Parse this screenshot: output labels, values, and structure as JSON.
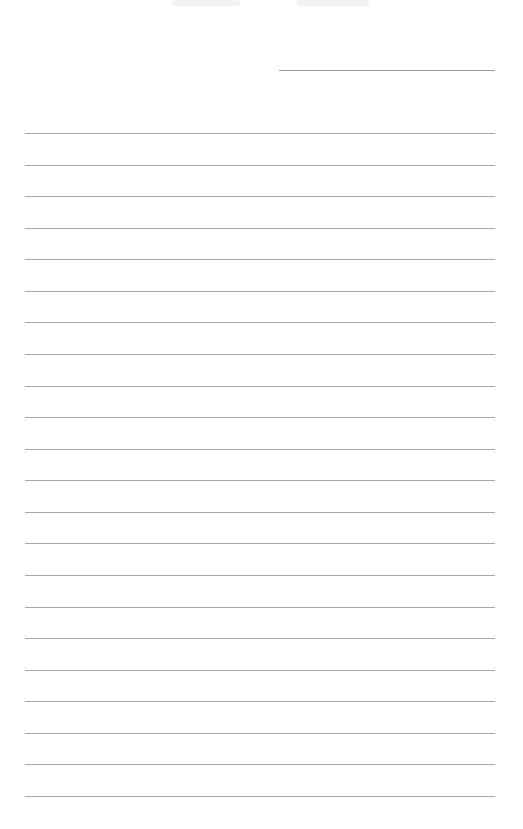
{
  "document": {
    "type": "lined-paper",
    "background_color": "#ffffff",
    "line_color": "#a8a8a8",
    "header_line": {
      "left": 279,
      "top": 70,
      "width": 216
    },
    "ruled_lines": {
      "count": 22,
      "left": 25,
      "width": 470,
      "first_top": 133,
      "spacing": 31.57
    }
  }
}
